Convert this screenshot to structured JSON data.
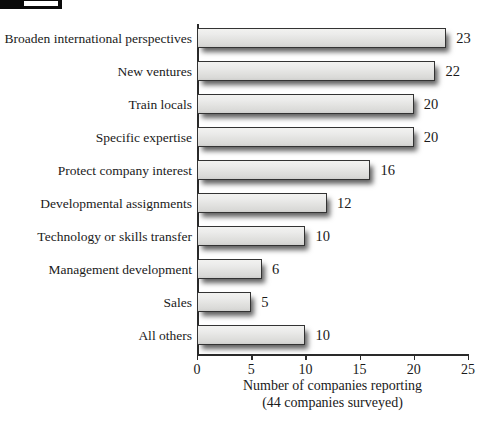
{
  "artifact": {
    "name": "cropped-header-bar"
  },
  "chart_data": {
    "type": "bar",
    "orientation": "horizontal",
    "title": "",
    "xlabel": "Number of companies reporting",
    "xlabel_sub": "(44 companies surveyed)",
    "ylabel": "",
    "xlim": [
      0,
      25
    ],
    "grid": false,
    "legend": null,
    "xticks": [
      0,
      5,
      10,
      15,
      20,
      25
    ],
    "xtick_labels": [
      "0",
      "5",
      "10",
      "15",
      "20",
      "25"
    ],
    "categories": [
      "Broaden international perspectives",
      "New ventures",
      "Train locals",
      "Specific expertise",
      "Protect company interest",
      "Developmental assignments",
      "Technology or skills transfer",
      "Management development",
      "Sales",
      "All others"
    ],
    "values": [
      23,
      22,
      20,
      20,
      16,
      12,
      10,
      6,
      5,
      10
    ],
    "value_labels": [
      "23",
      "22",
      "20",
      "20",
      "16",
      "12",
      "10",
      "6",
      "5",
      "10"
    ],
    "colors": {
      "bar_fill_light": "#f2f2f0",
      "bar_fill_dark": "#cfcfcd",
      "bar_border": "#333333",
      "axis": "#2a2a2a",
      "text": "#1a1a1a",
      "background": "#ffffff"
    }
  }
}
